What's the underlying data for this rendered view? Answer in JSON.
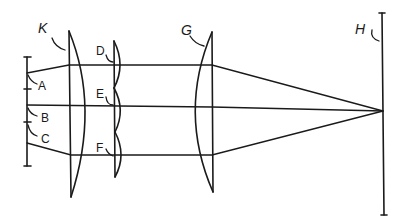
{
  "diagram": {
    "labels": {
      "K": "K",
      "D": "D",
      "E": "E",
      "F": "F",
      "G": "G",
      "H": "H",
      "A": "A",
      "B": "B",
      "C": "C"
    },
    "colors": {
      "ink": "#1a1a1a",
      "background": "#ffffff"
    }
  }
}
